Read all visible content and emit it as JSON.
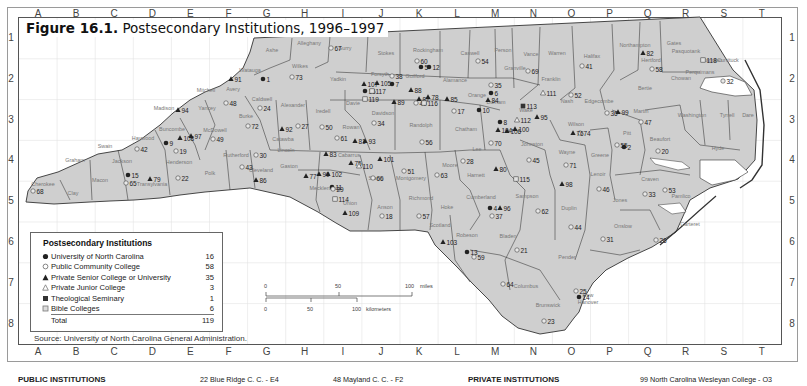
{
  "figure": {
    "label": "Figure 16.1.",
    "title": "Postsecondary Institutions, 1996–1997"
  },
  "grid": {
    "columns": [
      "A",
      "B",
      "C",
      "D",
      "E",
      "F",
      "G",
      "H",
      "I",
      "J",
      "K",
      "L",
      "M",
      "N",
      "O",
      "P",
      "Q",
      "R",
      "S",
      "T"
    ],
    "rows": [
      "1",
      "2",
      "3",
      "4",
      "5",
      "6",
      "7",
      "8"
    ]
  },
  "legend": {
    "title": "Postsecondary Institutions",
    "items": [
      {
        "symbol": "filled-circle",
        "label": "University of North Carolina",
        "count": "16"
      },
      {
        "symbol": "open-circle",
        "label": "Public Community College",
        "count": "58"
      },
      {
        "symbol": "filled-triangle",
        "label": "Private Senior College or University",
        "count": "35"
      },
      {
        "symbol": "open-triangle",
        "label": "Private Junior College",
        "count": "3"
      },
      {
        "symbol": "filled-square",
        "label": "Theological Seminary",
        "count": "1"
      },
      {
        "symbol": "open-square",
        "label": "Bible Colleges",
        "count": "6"
      }
    ],
    "total_label": "Total",
    "total_count": "119"
  },
  "source": "Source: University of North Carolina General Administration.",
  "scale": {
    "miles_ticks": [
      "0",
      "50",
      "100"
    ],
    "miles_unit": "miles",
    "km_ticks": [
      "0",
      "50",
      "100"
    ],
    "km_unit": "kilometers"
  },
  "bottom": {
    "public_heading": "PUBLIC INSTITUTIONS",
    "entry_22": "22  Blue Ridge C. C. - E4",
    "entry_48": "48  Mayland C. C. - F2",
    "private_heading": "PRIVATE INSTITUTIONS",
    "entry_99": "99  North Carolina Wesleyan College  -  O3"
  },
  "colors": {
    "state_fill": "#cfcfcf",
    "county_border": "#333333",
    "grid_line": "#dddddd",
    "marker": "#222222"
  },
  "counties": [
    {
      "name": "Ashe",
      "x": 272,
      "y": 52
    },
    {
      "name": "Alleghany",
      "x": 309,
      "y": 45
    },
    {
      "name": "Surry",
      "x": 345,
      "y": 50
    },
    {
      "name": "Stokes",
      "x": 386,
      "y": 55
    },
    {
      "name": "Rockingham",
      "x": 428,
      "y": 52
    },
    {
      "name": "Caswell",
      "x": 470,
      "y": 55
    },
    {
      "name": "Person",
      "x": 503,
      "y": 52
    },
    {
      "name": "Vance",
      "x": 531,
      "y": 56
    },
    {
      "name": "Warren",
      "x": 557,
      "y": 55
    },
    {
      "name": "Halifax",
      "x": 592,
      "y": 58
    },
    {
      "name": "Northampton",
      "x": 635,
      "y": 47
    },
    {
      "name": "Gates",
      "x": 674,
      "y": 45
    },
    {
      "name": "Pasquotank",
      "x": 686,
      "y": 53
    },
    {
      "name": "Hertford",
      "x": 651,
      "y": 62
    },
    {
      "name": "Watauga",
      "x": 250,
      "y": 72
    },
    {
      "name": "Wilkes",
      "x": 300,
      "y": 68
    },
    {
      "name": "Yadkin",
      "x": 338,
      "y": 81
    },
    {
      "name": "Forsyth",
      "x": 380,
      "y": 76
    },
    {
      "name": "Guilford",
      "x": 415,
      "y": 78
    },
    {
      "name": "Alamance",
      "x": 455,
      "y": 82
    },
    {
      "name": "Orange",
      "x": 477,
      "y": 97
    },
    {
      "name": "Durham",
      "x": 496,
      "y": 104
    },
    {
      "name": "Granville",
      "x": 515,
      "y": 70
    },
    {
      "name": "Franklin",
      "x": 551,
      "y": 81
    },
    {
      "name": "Bertie",
      "x": 645,
      "y": 90
    },
    {
      "name": "Mitchell",
      "x": 206,
      "y": 92
    },
    {
      "name": "Avery",
      "x": 233,
      "y": 91
    },
    {
      "name": "Yancey",
      "x": 207,
      "y": 110
    },
    {
      "name": "Caldwell",
      "x": 262,
      "y": 101
    },
    {
      "name": "Alexander",
      "x": 293,
      "y": 107
    },
    {
      "name": "Iredell",
      "x": 323,
      "y": 113
    },
    {
      "name": "Davie",
      "x": 353,
      "y": 105
    },
    {
      "name": "Davidson",
      "x": 383,
      "y": 115
    },
    {
      "name": "Randolph",
      "x": 421,
      "y": 127
    },
    {
      "name": "Chatham",
      "x": 466,
      "y": 131
    },
    {
      "name": "Wake",
      "x": 526,
      "y": 112
    },
    {
      "name": "Nash",
      "x": 567,
      "y": 103
    },
    {
      "name": "Edgecombe",
      "x": 599,
      "y": 103
    },
    {
      "name": "Martin",
      "x": 641,
      "y": 113
    },
    {
      "name": "Washington",
      "x": 692,
      "y": 117
    },
    {
      "name": "Tyrrell",
      "x": 727,
      "y": 117
    },
    {
      "name": "Dare",
      "x": 748,
      "y": 117
    },
    {
      "name": "Madison",
      "x": 164,
      "y": 110
    },
    {
      "name": "Burke",
      "x": 246,
      "y": 118
    },
    {
      "name": "Catawba",
      "x": 283,
      "y": 141
    },
    {
      "name": "Rowan",
      "x": 351,
      "y": 129
    },
    {
      "name": "Wilson",
      "x": 576,
      "y": 126
    },
    {
      "name": "Beaufort",
      "x": 660,
      "y": 141
    },
    {
      "name": "Hyde",
      "x": 718,
      "y": 150
    },
    {
      "name": "Buncombe",
      "x": 172,
      "y": 131
    },
    {
      "name": "McDowell",
      "x": 215,
      "y": 132
    },
    {
      "name": "Haywood",
      "x": 143,
      "y": 140
    },
    {
      "name": "Swain",
      "x": 105,
      "y": 148
    },
    {
      "name": "Graham",
      "x": 75,
      "y": 162
    },
    {
      "name": "Jackson",
      "x": 122,
      "y": 163
    },
    {
      "name": "Henderson",
      "x": 179,
      "y": 164
    },
    {
      "name": "Rutherford",
      "x": 236,
      "y": 157
    },
    {
      "name": "Polk",
      "x": 210,
      "y": 175
    },
    {
      "name": "Lincoln",
      "x": 286,
      "y": 152
    },
    {
      "name": "Cleveland",
      "x": 261,
      "y": 172
    },
    {
      "name": "Gaston",
      "x": 289,
      "y": 168
    },
    {
      "name": "Cabarrus",
      "x": 349,
      "y": 157
    },
    {
      "name": "Stanly",
      "x": 376,
      "y": 180
    },
    {
      "name": "Montgomery",
      "x": 411,
      "y": 180
    },
    {
      "name": "Moore",
      "x": 450,
      "y": 167
    },
    {
      "name": "Lee",
      "x": 477,
      "y": 151
    },
    {
      "name": "Johnston",
      "x": 532,
      "y": 146
    },
    {
      "name": "Harnett",
      "x": 476,
      "y": 177
    },
    {
      "name": "Wayne",
      "x": 567,
      "y": 154
    },
    {
      "name": "Greene",
      "x": 600,
      "y": 157
    },
    {
      "name": "Pitt",
      "x": 627,
      "y": 135
    },
    {
      "name": "Lenoir",
      "x": 598,
      "y": 176
    },
    {
      "name": "Craven",
      "x": 650,
      "y": 181
    },
    {
      "name": "Pamlico",
      "x": 681,
      "y": 198
    },
    {
      "name": "Jones",
      "x": 620,
      "y": 202
    },
    {
      "name": "Cherokee",
      "x": 43,
      "y": 186
    },
    {
      "name": "Clay",
      "x": 73,
      "y": 195
    },
    {
      "name": "Macon",
      "x": 100,
      "y": 182
    },
    {
      "name": "Transylvania",
      "x": 152,
      "y": 186
    },
    {
      "name": "Mecklenburg",
      "x": 325,
      "y": 190
    },
    {
      "name": "Union",
      "x": 350,
      "y": 205
    },
    {
      "name": "Anson",
      "x": 385,
      "y": 209
    },
    {
      "name": "Richmond",
      "x": 421,
      "y": 200
    },
    {
      "name": "Hoke",
      "x": 447,
      "y": 209
    },
    {
      "name": "Cumberland",
      "x": 481,
      "y": 199
    },
    {
      "name": "Sampson",
      "x": 527,
      "y": 198
    },
    {
      "name": "Duplin",
      "x": 569,
      "y": 210
    },
    {
      "name": "Onslow",
      "x": 623,
      "y": 228
    },
    {
      "name": "Carteret",
      "x": 690,
      "y": 226
    },
    {
      "name": "Scotland",
      "x": 440,
      "y": 227
    },
    {
      "name": "Robeson",
      "x": 467,
      "y": 237
    },
    {
      "name": "Bladen",
      "x": 508,
      "y": 238
    },
    {
      "name": "Pender",
      "x": 567,
      "y": 259
    },
    {
      "name": "Columbus",
      "x": 526,
      "y": 288
    },
    {
      "name": "Brunswick",
      "x": 548,
      "y": 307
    },
    {
      "name": "New",
      "x": 588,
      "y": 297
    },
    {
      "name": "Hanover",
      "x": 588,
      "y": 304
    },
    {
      "name": "Chowan",
      "x": 681,
      "y": 80
    },
    {
      "name": "Perquimans",
      "x": 700,
      "y": 74
    },
    {
      "name": "Camden",
      "x": 712,
      "y": 62
    },
    {
      "name": "Currituck",
      "x": 728,
      "y": 62
    }
  ],
  "institutions": [
    {
      "id": "1",
      "type": "uc",
      "x": 263,
      "y": 79
    },
    {
      "id": "2",
      "type": "uc",
      "x": 624,
      "y": 147
    },
    {
      "id": "4",
      "type": "uc",
      "x": 490,
      "y": 208
    },
    {
      "id": "5",
      "type": "uc",
      "x": 421,
      "y": 67
    },
    {
      "id": "6",
      "type": "uc",
      "x": 491,
      "y": 93
    },
    {
      "id": "7",
      "type": "uc",
      "x": 392,
      "y": 84
    },
    {
      "id": "8",
      "type": "uc",
      "x": 500,
      "y": 122
    },
    {
      "id": "9",
      "type": "uc",
      "x": 166,
      "y": 143
    },
    {
      "id": "10",
      "type": "uc",
      "x": 479,
      "y": 110
    },
    {
      "id": "11",
      "type": "uc",
      "x": 332,
      "y": 187
    },
    {
      "id": "12",
      "type": "uc",
      "x": 429,
      "y": 67
    },
    {
      "id": "13",
      "type": "uc",
      "x": 467,
      "y": 252
    },
    {
      "id": "14",
      "type": "uc",
      "x": 579,
      "y": 297
    },
    {
      "id": "15",
      "type": "uc",
      "x": 128,
      "y": 175
    },
    {
      "id": "16",
      "type": "uc",
      "x": 365,
      "y": 91
    },
    {
      "id": "17",
      "type": "cc",
      "x": 454,
      "y": 111
    },
    {
      "id": "18",
      "type": "cc",
      "x": 382,
      "y": 216
    },
    {
      "id": "19",
      "type": "cc",
      "x": 176,
      "y": 151
    },
    {
      "id": "20",
      "type": "cc",
      "x": 658,
      "y": 151
    },
    {
      "id": "21",
      "type": "cc",
      "x": 517,
      "y": 250
    },
    {
      "id": "22",
      "type": "cc",
      "x": 178,
      "y": 178
    },
    {
      "id": "23",
      "type": "cc",
      "x": 544,
      "y": 321
    },
    {
      "id": "24",
      "type": "cc",
      "x": 260,
      "y": 108
    },
    {
      "id": "25",
      "type": "cc",
      "x": 576,
      "y": 291
    },
    {
      "id": "26",
      "type": "cc",
      "x": 656,
      "y": 240
    },
    {
      "id": "27",
      "type": "cc",
      "x": 298,
      "y": 126
    },
    {
      "id": "28",
      "type": "cc",
      "x": 463,
      "y": 161
    },
    {
      "id": "29",
      "type": "cc",
      "x": 333,
      "y": 189
    },
    {
      "id": "30",
      "type": "cc",
      "x": 256,
      "y": 155
    },
    {
      "id": "31",
      "type": "cc",
      "x": 603,
      "y": 239
    },
    {
      "id": "32",
      "type": "cc",
      "x": 723,
      "y": 81
    },
    {
      "id": "33",
      "type": "cc",
      "x": 645,
      "y": 194
    },
    {
      "id": "34",
      "type": "cc",
      "x": 374,
      "y": 123
    },
    {
      "id": "35",
      "type": "cc",
      "x": 491,
      "y": 85
    },
    {
      "id": "36",
      "type": "cc",
      "x": 607,
      "y": 113
    },
    {
      "id": "37",
      "type": "cc",
      "x": 492,
      "y": 216
    },
    {
      "id": "38",
      "type": "cc",
      "x": 392,
      "y": 76
    },
    {
      "id": "40",
      "type": "cc",
      "x": 416,
      "y": 103
    },
    {
      "id": "41",
      "type": "cc",
      "x": 582,
      "y": 66
    },
    {
      "id": "42",
      "type": "cc",
      "x": 137,
      "y": 149
    },
    {
      "id": "43",
      "type": "cc",
      "x": 242,
      "y": 167
    },
    {
      "id": "44",
      "type": "cc",
      "x": 571,
      "y": 227
    },
    {
      "id": "45",
      "type": "cc",
      "x": 529,
      "y": 160
    },
    {
      "id": "46",
      "type": "cc",
      "x": 599,
      "y": 189
    },
    {
      "id": "47",
      "type": "cc",
      "x": 641,
      "y": 122
    },
    {
      "id": "48",
      "type": "cc",
      "x": 226,
      "y": 103
    },
    {
      "id": "49",
      "type": "cc",
      "x": 213,
      "y": 139
    },
    {
      "id": "50",
      "type": "cc",
      "x": 322,
      "y": 127
    },
    {
      "id": "51",
      "type": "cc",
      "x": 404,
      "y": 171
    },
    {
      "id": "52",
      "type": "cc",
      "x": 571,
      "y": 95
    },
    {
      "id": "53",
      "type": "cc",
      "x": 665,
      "y": 190
    },
    {
      "id": "54",
      "type": "cc",
      "x": 478,
      "y": 61
    },
    {
      "id": "55",
      "type": "cc",
      "x": 617,
      "y": 145
    },
    {
      "id": "56",
      "type": "cc",
      "x": 422,
      "y": 142
    },
    {
      "id": "57",
      "type": "cc",
      "x": 419,
      "y": 216
    },
    {
      "id": "58",
      "type": "cc",
      "x": 652,
      "y": 69
    },
    {
      "id": "59",
      "type": "cc",
      "x": 474,
      "y": 257
    },
    {
      "id": "60",
      "type": "cc",
      "x": 417,
      "y": 61
    },
    {
      "id": "61",
      "type": "cc",
      "x": 337,
      "y": 138
    },
    {
      "id": "62",
      "type": "cc",
      "x": 538,
      "y": 211
    },
    {
      "id": "63",
      "type": "cc",
      "x": 437,
      "y": 175
    },
    {
      "id": "64",
      "type": "cc",
      "x": 503,
      "y": 284
    },
    {
      "id": "65",
      "type": "cc",
      "x": 126,
      "y": 183
    },
    {
      "id": "66",
      "type": "cc",
      "x": 373,
      "y": 178
    },
    {
      "id": "67",
      "type": "cc",
      "x": 331,
      "y": 48
    },
    {
      "id": "68",
      "type": "cc",
      "x": 33,
      "y": 191
    },
    {
      "id": "69",
      "type": "cc",
      "x": 528,
      "y": 71
    },
    {
      "id": "70",
      "type": "cc",
      "x": 491,
      "y": 143
    },
    {
      "id": "71",
      "type": "cc",
      "x": 566,
      "y": 165
    },
    {
      "id": "72",
      "type": "cc",
      "x": 248,
      "y": 126
    },
    {
      "id": "73",
      "type": "cc",
      "x": 292,
      "y": 77
    },
    {
      "id": "74",
      "type": "cc",
      "x": 580,
      "y": 133
    },
    {
      "id": "75",
      "type": "ps",
      "x": 351,
      "y": 163
    },
    {
      "id": "76",
      "type": "ps",
      "x": 573,
      "y": 133
    },
    {
      "id": "77",
      "type": "ps",
      "x": 306,
      "y": 176
    },
    {
      "id": "78",
      "type": "ps",
      "x": 428,
      "y": 97
    },
    {
      "id": "79",
      "type": "ps",
      "x": 150,
      "y": 179
    },
    {
      "id": "80",
      "type": "ps",
      "x": 496,
      "y": 169
    },
    {
      "id": "81",
      "type": "ps",
      "x": 355,
      "y": 141
    },
    {
      "id": "82",
      "type": "ps",
      "x": 643,
      "y": 53
    },
    {
      "id": "83",
      "type": "ps",
      "x": 326,
      "y": 154
    },
    {
      "id": "84",
      "type": "ps",
      "x": 488,
      "y": 100
    },
    {
      "id": "85",
      "type": "ps",
      "x": 447,
      "y": 99
    },
    {
      "id": "86",
      "type": "ps",
      "x": 256,
      "y": 180
    },
    {
      "id": "87",
      "type": "ps",
      "x": 419,
      "y": 99
    },
    {
      "id": "88",
      "type": "ps",
      "x": 411,
      "y": 90
    },
    {
      "id": "89",
      "type": "ps",
      "x": 394,
      "y": 102
    },
    {
      "id": "90",
      "type": "ps",
      "x": 319,
      "y": 174
    },
    {
      "id": "91",
      "type": "ps",
      "x": 231,
      "y": 79
    },
    {
      "id": "92",
      "type": "ps",
      "x": 282,
      "y": 129
    },
    {
      "id": "93",
      "type": "ps",
      "x": 365,
      "y": 141
    },
    {
      "id": "94",
      "type": "ps",
      "x": 178,
      "y": 110
    },
    {
      "id": "95",
      "type": "ps",
      "x": 537,
      "y": 117
    },
    {
      "id": "96",
      "type": "ps",
      "x": 500,
      "y": 208
    },
    {
      "id": "97",
      "type": "ps",
      "x": 191,
      "y": 136
    },
    {
      "id": "98",
      "type": "ps",
      "x": 562,
      "y": 184
    },
    {
      "id": "99",
      "type": "ps",
      "x": 618,
      "y": 112
    },
    {
      "id": "100",
      "type": "ps",
      "x": 515,
      "y": 129
    },
    {
      "id": "101",
      "type": "ps",
      "x": 380,
      "y": 159
    },
    {
      "id": "102",
      "type": "ps",
      "x": 328,
      "y": 174
    },
    {
      "id": "103",
      "type": "ps",
      "x": 443,
      "y": 242
    },
    {
      "id": "104",
      "type": "ps",
      "x": 498,
      "y": 130
    },
    {
      "id": "105",
      "type": "ps",
      "x": 377,
      "y": 83
    },
    {
      "id": "106",
      "type": "ps",
      "x": 507,
      "y": 131
    },
    {
      "id": "107",
      "type": "ps",
      "x": 364,
      "y": 84
    },
    {
      "id": "108",
      "type": "ps",
      "x": 180,
      "y": 138
    },
    {
      "id": "109",
      "type": "ps",
      "x": 345,
      "y": 213
    },
    {
      "id": "110",
      "type": "pj",
      "x": 359,
      "y": 166
    },
    {
      "id": "111",
      "type": "pj",
      "x": 543,
      "y": 93
    },
    {
      "id": "112",
      "type": "pj",
      "x": 517,
      "y": 120
    },
    {
      "id": "113",
      "type": "ts",
      "x": 523,
      "y": 106
    },
    {
      "id": "114",
      "type": "bc",
      "x": 335,
      "y": 199
    },
    {
      "id": "115",
      "type": "bc",
      "x": 516,
      "y": 179
    },
    {
      "id": "116",
      "type": "bc",
      "x": 424,
      "y": 103
    },
    {
      "id": "117",
      "type": "bc",
      "x": 372,
      "y": 91
    },
    {
      "id": "118",
      "type": "bc",
      "x": 703,
      "y": 60
    },
    {
      "id": "119",
      "type": "bc",
      "x": 365,
      "y": 99
    }
  ]
}
